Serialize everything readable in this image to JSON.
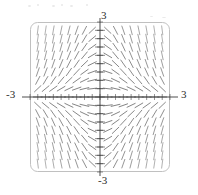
{
  "figure": {
    "kind": "slope-field",
    "frame": {
      "x0": 30,
      "y0": 22,
      "x1": 170,
      "y1": 172,
      "corner_radius": 7
    },
    "origin_px": {
      "x": 100,
      "y": 97
    },
    "colors": {
      "stroke": "#5b5b5b",
      "axis": "#3a3a3a",
      "frame": "#b9b9b9",
      "background": "#ffffff",
      "label": "#2b2b2b",
      "speck": "#e9e9e9"
    },
    "labels": {
      "top": "3",
      "bottom": "-3",
      "left": "-3",
      "right": "3"
    },
    "tick": {
      "count_per_axis": 19,
      "length_px": 3
    },
    "specks": [
      {
        "x": 28,
        "y": 5,
        "w": 3,
        "h": 2
      },
      {
        "x": 37,
        "y": 4,
        "w": 2,
        "h": 2
      },
      {
        "x": 52,
        "y": 5,
        "w": 3,
        "h": 2
      },
      {
        "x": 61,
        "y": 4,
        "w": 2,
        "h": 2
      },
      {
        "x": 70,
        "y": 5,
        "w": 3,
        "h": 2
      },
      {
        "x": 86,
        "y": 4,
        "w": 2,
        "h": 2
      },
      {
        "x": 150,
        "y": 16,
        "w": 3,
        "h": 1
      },
      {
        "x": 162,
        "y": 17,
        "w": 4,
        "h": 1
      }
    ]
  },
  "chart_data": {
    "type": "slope-field",
    "title": "",
    "xlabel": "",
    "ylabel": "",
    "xlim": [
      -3,
      3
    ],
    "ylim": [
      -3,
      3
    ],
    "xticks": [
      -3,
      3
    ],
    "yticks": [
      -3,
      3
    ],
    "xtick_labels": [
      "-3",
      "3"
    ],
    "ytick_labels": [
      "-3",
      "3"
    ],
    "grid": false,
    "legend": null,
    "equation": "dy/dx = -x*y",
    "grid_nx": 19,
    "grid_ny": 19,
    "segment_length_px": 9,
    "samples": [
      {
        "x": -3.0,
        "y": 3.0,
        "slope": 9.0
      },
      {
        "x": -1.5,
        "y": 3.0,
        "slope": 4.5
      },
      {
        "x": 0.0,
        "y": 3.0,
        "slope": 0.0
      },
      {
        "x": 1.5,
        "y": 3.0,
        "slope": -4.5
      },
      {
        "x": 3.0,
        "y": 3.0,
        "slope": -9.0
      },
      {
        "x": -3.0,
        "y": 1.5,
        "slope": 4.5
      },
      {
        "x": -1.5,
        "y": 1.5,
        "slope": 2.25
      },
      {
        "x": 0.0,
        "y": 1.5,
        "slope": 0.0
      },
      {
        "x": 1.5,
        "y": 1.5,
        "slope": -2.25
      },
      {
        "x": 3.0,
        "y": 1.5,
        "slope": -4.5
      },
      {
        "x": -3.0,
        "y": 0.0,
        "slope": 0.0
      },
      {
        "x": -1.5,
        "y": 0.0,
        "slope": 0.0
      },
      {
        "x": 0.0,
        "y": 0.0,
        "slope": 0.0
      },
      {
        "x": 1.5,
        "y": 0.0,
        "slope": 0.0
      },
      {
        "x": 3.0,
        "y": 0.0,
        "slope": 0.0
      },
      {
        "x": -3.0,
        "y": -1.5,
        "slope": -4.5
      },
      {
        "x": -1.5,
        "y": -1.5,
        "slope": -2.25
      },
      {
        "x": 0.0,
        "y": -1.5,
        "slope": 0.0
      },
      {
        "x": 1.5,
        "y": -1.5,
        "slope": 2.25
      },
      {
        "x": 3.0,
        "y": -1.5,
        "slope": 4.5
      },
      {
        "x": -3.0,
        "y": -3.0,
        "slope": -9.0
      },
      {
        "x": -1.5,
        "y": -3.0,
        "slope": -4.5
      },
      {
        "x": 0.0,
        "y": -3.0,
        "slope": 0.0
      },
      {
        "x": 1.5,
        "y": -3.0,
        "slope": 4.5
      },
      {
        "x": 3.0,
        "y": -3.0,
        "slope": 9.0
      }
    ]
  }
}
